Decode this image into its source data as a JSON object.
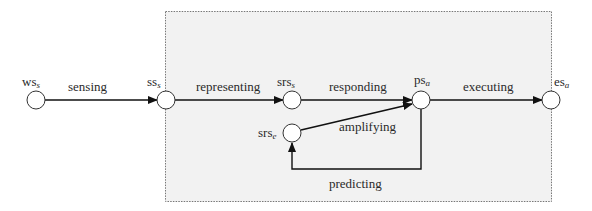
{
  "diagram": {
    "colors": {
      "background": "#ffffff",
      "box_fill": "#f2f2f2",
      "box_border": "#777777",
      "line": "#111111",
      "node_fill": "#ffffff",
      "text": "#2a2a2a"
    },
    "nodes": [
      {
        "id": "ws_s",
        "base": "ws",
        "sub": "s",
        "cx": 36,
        "cy": 100
      },
      {
        "id": "ss_s",
        "base": "ss",
        "sub": "s",
        "cx": 166,
        "cy": 100
      },
      {
        "id": "srs_s",
        "base": "srs",
        "sub": "s",
        "cx": 292,
        "cy": 100
      },
      {
        "id": "srs_e",
        "base": "srs",
        "sub": "e",
        "cx": 292,
        "cy": 133
      },
      {
        "id": "ps_a",
        "base": "ps",
        "sub": "a",
        "cx": 421,
        "cy": 100
      },
      {
        "id": "es_a",
        "base": "es",
        "sub": "a",
        "cx": 551,
        "cy": 100
      }
    ],
    "edges": [
      {
        "id": "sensing",
        "label": "sensing",
        "from": "ws_s",
        "to": "ss_s"
      },
      {
        "id": "representing",
        "label": "representing",
        "from": "ss_s",
        "to": "srs_s"
      },
      {
        "id": "responding",
        "label": "responding",
        "from": "srs_s",
        "to": "ps_a"
      },
      {
        "id": "executing",
        "label": "executing",
        "from": "ps_a",
        "to": "es_a"
      },
      {
        "id": "amplifying",
        "label": "amplifying",
        "from": "srs_e",
        "to": "ps_a"
      },
      {
        "id": "predicting",
        "label": "predicting",
        "from": "ps_a",
        "to": "srs_e"
      }
    ],
    "labels": {
      "ws_s": {
        "base": "ws",
        "sub": "s"
      },
      "ss_s": {
        "base": "ss",
        "sub": "s"
      },
      "srs_s": {
        "base": "srs",
        "sub": "s"
      },
      "srs_e": {
        "base": "srs",
        "sub": "e"
      },
      "ps_a": {
        "base": "ps",
        "sub": "a"
      },
      "es_a": {
        "base": "es",
        "sub": "a"
      },
      "sensing": "sensing",
      "representing": "representing",
      "responding": "responding",
      "executing": "executing",
      "amplifying": "amplifying",
      "predicting": "predicting"
    }
  }
}
